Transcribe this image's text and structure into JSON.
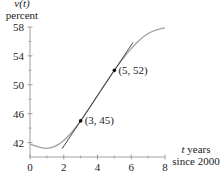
{
  "chart_data": {
    "type": "line",
    "title": "",
    "ylabel_top": "v(t)",
    "ylabel_bottom": "percent",
    "xlabel_line1": "t years",
    "xlabel_line2": "since 2000",
    "xlim": [
      0,
      8
    ],
    "ylim": [
      40,
      58
    ],
    "x_ticks": [
      0,
      2,
      4,
      6,
      8
    ],
    "x_tick_labels": [
      "0",
      "2",
      "4",
      "6",
      "8"
    ],
    "x_minor_ticks": [
      1,
      3,
      5,
      7
    ],
    "y_ticks": [
      42,
      46,
      50,
      54,
      58
    ],
    "y_tick_labels": [
      "42",
      "46",
      "50",
      "54",
      "58"
    ],
    "y_minor_ticks": [
      44,
      48,
      52,
      56
    ],
    "grid": false,
    "series": [
      {
        "name": "v(t)",
        "x": [
          0,
          0.5,
          1,
          1.5,
          2,
          2.5,
          3,
          3.5,
          4,
          4.5,
          5,
          5.5,
          6,
          6.5,
          7,
          7.5,
          8
        ],
        "values": [
          41.8,
          41.4,
          41.2,
          41.5,
          42.3,
          43.5,
          45,
          46.7,
          48.5,
          50.3,
          52,
          53.6,
          55,
          56.2,
          57.1,
          57.6,
          57.9
        ]
      },
      {
        "name": "secant line",
        "x": [
          1.9,
          6.1
        ],
        "values": [
          41.15,
          55.85
        ]
      }
    ],
    "annotations": [
      {
        "label": "(3, 45)",
        "x": 3,
        "y": 45
      },
      {
        "label": "(5, 52)",
        "x": 5,
        "y": 52
      }
    ],
    "colors": {
      "curve": "#a0a0a0",
      "line": "#333333",
      "axis": "#888888",
      "point": "#111111"
    }
  }
}
